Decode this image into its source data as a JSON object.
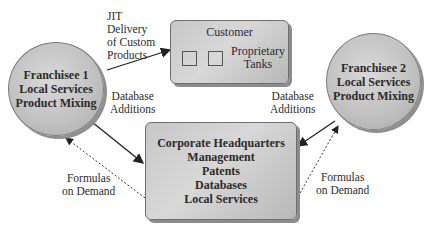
{
  "diagram": {
    "franchisee1": {
      "lines": [
        "Franchisee 1",
        "Local Services",
        "Product Mixing"
      ]
    },
    "franchisee2": {
      "lines": [
        "Franchisee 2",
        "Local Services",
        "Product Mixing"
      ]
    },
    "customer": {
      "title": "Customer",
      "tanks_label": [
        "Proprietary",
        "Tanks"
      ],
      "tank_count": 2
    },
    "hq": {
      "lines": [
        "Corporate Headquarters",
        "Management",
        "Patents",
        "Databases",
        "Local Services"
      ]
    },
    "edges": {
      "jit": [
        "JIT",
        "Delivery",
        "of Custom",
        "Products"
      ],
      "db_additions_left": [
        "Database",
        "Additions"
      ],
      "db_additions_right": [
        "Database",
        "Additions"
      ],
      "formulas_left": [
        "Formulas",
        "on Demand"
      ],
      "formulas_right": [
        "Formulas",
        "on Demand"
      ]
    }
  }
}
